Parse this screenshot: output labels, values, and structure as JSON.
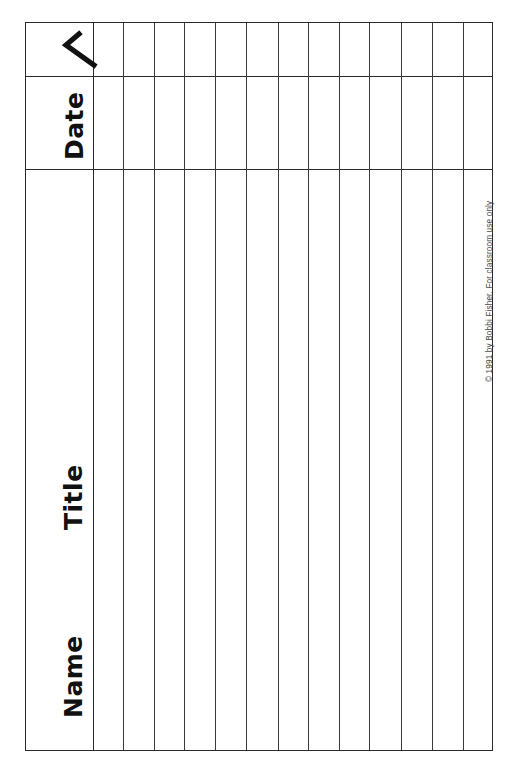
{
  "document": {
    "type": "printable-record-sheet",
    "title": "Reading Record Sheet",
    "background_color": "#ffffff",
    "ink_color": "#2b2b2b"
  },
  "header_rows": {
    "check_row": {
      "label_icon": "checkmark-icon",
      "label_text": "✓"
    },
    "date_row": {
      "label_text": "Date"
    }
  },
  "body_rows": [
    {
      "label_text": "Title"
    },
    {
      "label_text": "Name"
    }
  ],
  "labels": {
    "check": "✓",
    "date": "Date",
    "title": "Title",
    "name": "Name"
  },
  "footer": {
    "copyright": "© 1991 by Bobbi Fisher. For classroom use only"
  },
  "grid": {
    "column_count": 15,
    "row_count": 3,
    "vertical_rule_x": [
      92,
      122,
      153,
      183,
      214,
      245,
      277,
      307,
      338,
      368,
      400,
      431,
      462
    ],
    "horizontal_rule_y": [
      75,
      168
    ],
    "bounds": {
      "left": 25,
      "top": 22,
      "right": 493,
      "bottom": 751
    }
  }
}
